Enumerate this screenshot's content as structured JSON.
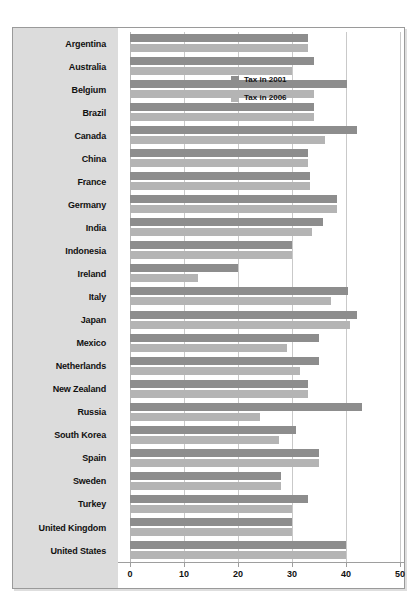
{
  "page": {
    "faint_top_text": ""
  },
  "legend": {
    "position": "top-right-inside",
    "entries": [
      {
        "label": "Tax in 2001",
        "color": "#8d8d8d"
      },
      {
        "label": "Tax in 2006",
        "color": "#b4b4b4"
      }
    ]
  },
  "axis": {
    "ticks": [
      "0",
      "10",
      "20",
      "30",
      "40",
      "50"
    ]
  },
  "chart_data": {
    "type": "bar",
    "orientation": "horizontal",
    "title": "",
    "xlabel": "",
    "ylabel": "",
    "xlim": [
      0,
      50
    ],
    "xticks": [
      0,
      10,
      20,
      30,
      40,
      50
    ],
    "grid": true,
    "legend_position": "top-right",
    "categories": [
      "Argentina",
      "Australia",
      "Belgium",
      "Brazil",
      "Canada",
      "China",
      "France",
      "Germany",
      "India",
      "Indonesia",
      "Ireland",
      "Italy",
      "Japan",
      "Mexico",
      "Netherlands",
      "New Zealand",
      "Russia",
      "South Korea",
      "Spain",
      "Sweden",
      "Turkey",
      "United Kingdom",
      "United States"
    ],
    "series": [
      {
        "name": "Tax in 2001",
        "color": "#8d8d8d",
        "values": [
          33.0,
          34.0,
          40.2,
          34.0,
          42.1,
          33.0,
          33.3,
          38.4,
          35.7,
          30.0,
          20.0,
          40.3,
          42.0,
          35.0,
          35.0,
          33.0,
          43.0,
          30.8,
          35.0,
          28.0,
          33.0,
          30.0,
          40.0
        ]
      },
      {
        "name": "Tax in 2006",
        "color": "#b4b4b4",
        "values": [
          33.0,
          30.0,
          34.0,
          34.0,
          36.1,
          33.0,
          33.3,
          38.4,
          33.7,
          30.0,
          12.5,
          37.3,
          40.7,
          29.0,
          31.4,
          33.0,
          24.0,
          27.5,
          35.0,
          28.0,
          30.0,
          30.0,
          40.0
        ]
      }
    ]
  }
}
